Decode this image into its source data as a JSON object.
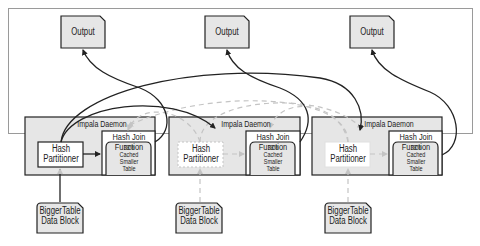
{
  "diagram": {
    "outputs": [
      {
        "label": "Output"
      },
      {
        "label": "Output"
      },
      {
        "label": "Output"
      }
    ],
    "daemons": [
      {
        "title": "Impala Daemon",
        "partitioner": "Hash Partitioner",
        "partitioner_lines": [
          "Hash",
          "Partitioner"
        ],
        "join_lines": [
          "Hash Join",
          "Function"
        ],
        "cache_lines": [
          "33%",
          "Cached",
          "Smaller",
          "Table"
        ],
        "active": true
      },
      {
        "title": "Impala Daemon",
        "partitioner_lines": [
          "Hash",
          "Partitioner"
        ],
        "join_lines": [
          "Hash Join",
          "Function"
        ],
        "cache_lines": [
          "33%",
          "Cached",
          "Smaller",
          "Table"
        ],
        "active": false
      },
      {
        "title": "Impala Daemon",
        "partitioner_lines": [
          "Hash",
          "Partitioner"
        ],
        "join_lines": [
          "Hash Join",
          "Function"
        ],
        "cache_lines": [
          "33%",
          "Cached",
          "Smaller",
          "Table"
        ],
        "active": false
      }
    ],
    "inputs": [
      {
        "lines": [
          "BiggerTable",
          "Data Block"
        ]
      },
      {
        "lines": [
          "BiggerTable",
          "Data Block"
        ]
      },
      {
        "lines": [
          "BiggerTable",
          "Data Block"
        ]
      }
    ],
    "colors": {
      "box_fill": "#e6e6e6",
      "stroke": "#222222",
      "dashed": "#c4c4c4",
      "frame": "#9a9a9a"
    }
  }
}
